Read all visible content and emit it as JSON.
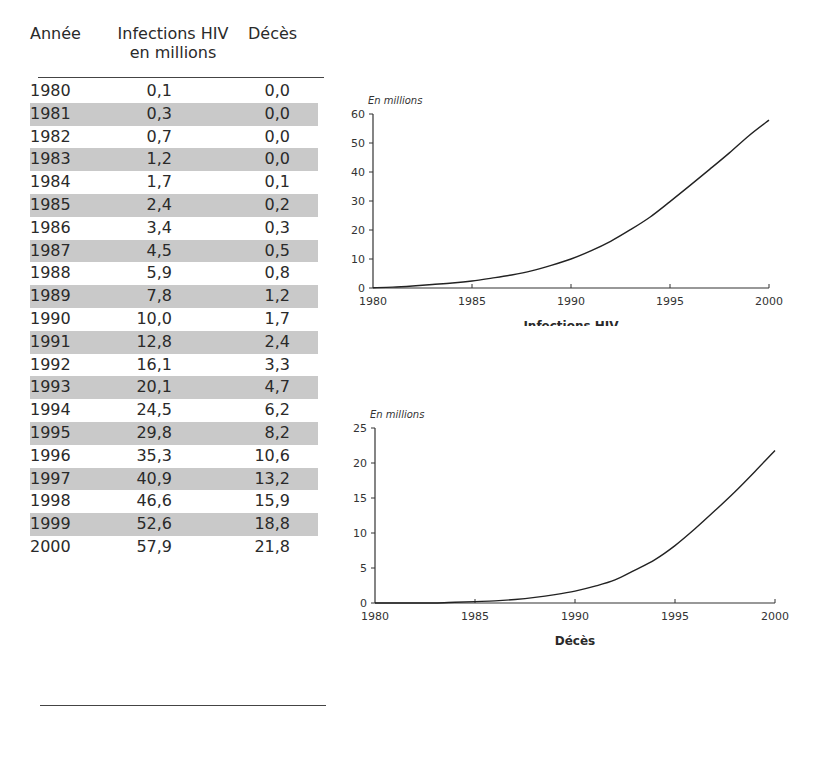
{
  "table": {
    "headers": {
      "year": "Année",
      "infections_line1": "Infections HIV",
      "infections_line2": "en millions",
      "deaths": "Décès"
    },
    "rows": [
      {
        "year": "1980",
        "infections": "0,1",
        "deaths": "0,0"
      },
      {
        "year": "1981",
        "infections": "0,3",
        "deaths": "0,0"
      },
      {
        "year": "1982",
        "infections": "0,7",
        "deaths": "0,0"
      },
      {
        "year": "1983",
        "infections": "1,2",
        "deaths": "0,0"
      },
      {
        "year": "1984",
        "infections": "1,7",
        "deaths": "0,1"
      },
      {
        "year": "1985",
        "infections": "2,4",
        "deaths": "0,2"
      },
      {
        "year": "1986",
        "infections": "3,4",
        "deaths": "0,3"
      },
      {
        "year": "1987",
        "infections": "4,5",
        "deaths": "0,5"
      },
      {
        "year": "1988",
        "infections": "5,9",
        "deaths": "0,8"
      },
      {
        "year": "1989",
        "infections": "7,8",
        "deaths": "1,2"
      },
      {
        "year": "1990",
        "infections": "10,0",
        "deaths": "1,7"
      },
      {
        "year": "1991",
        "infections": "12,8",
        "deaths": "2,4"
      },
      {
        "year": "1992",
        "infections": "16,1",
        "deaths": "3,3"
      },
      {
        "year": "1993",
        "infections": "20,1",
        "deaths": "4,7"
      },
      {
        "year": "1994",
        "infections": "24,5",
        "deaths": "6,2"
      },
      {
        "year": "1995",
        "infections": "29,8",
        "deaths": "8,2"
      },
      {
        "year": "1996",
        "infections": "35,3",
        "deaths": "10,6"
      },
      {
        "year": "1997",
        "infections": "40,9",
        "deaths": "13,2"
      },
      {
        "year": "1998",
        "infections": "46,6",
        "deaths": "15,9"
      },
      {
        "year": "1999",
        "infections": "52,6",
        "deaths": "18,8"
      },
      {
        "year": "2000",
        "infections": "57,9",
        "deaths": "21,8"
      }
    ]
  },
  "charts": {
    "infections": {
      "unit_label": "En millions",
      "title": "Infections HIV",
      "yticks": [
        "0",
        "10",
        "20",
        "30",
        "40",
        "50",
        "60"
      ],
      "xticks": [
        "1980",
        "1985",
        "1990",
        "1995",
        "2000"
      ]
    },
    "deaths": {
      "unit_label": "En millions",
      "title": "Décès",
      "yticks": [
        "0",
        "5",
        "10",
        "15",
        "20",
        "25"
      ],
      "xticks": [
        "1980",
        "1985",
        "1990",
        "1995",
        "2000"
      ]
    }
  },
  "chart_data": [
    {
      "type": "line",
      "title": "Infections HIV",
      "xlabel": "",
      "ylabel": "En millions",
      "x": [
        1980,
        1981,
        1982,
        1983,
        1984,
        1985,
        1986,
        1987,
        1988,
        1989,
        1990,
        1991,
        1992,
        1993,
        1994,
        1995,
        1996,
        1997,
        1998,
        1999,
        2000
      ],
      "series": [
        {
          "name": "Infections HIV (millions)",
          "values": [
            0.1,
            0.3,
            0.7,
            1.2,
            1.7,
            2.4,
            3.4,
            4.5,
            5.9,
            7.8,
            10.0,
            12.8,
            16.1,
            20.1,
            24.5,
            29.8,
            35.3,
            40.9,
            46.6,
            52.6,
            57.9
          ]
        }
      ],
      "xlim": [
        1980,
        2000
      ],
      "ylim": [
        0,
        60
      ],
      "yticks": [
        0,
        10,
        20,
        30,
        40,
        50,
        60
      ],
      "xticks": [
        1980,
        1985,
        1990,
        1995,
        2000
      ],
      "grid": false,
      "legend": "none"
    },
    {
      "type": "line",
      "title": "Décès",
      "xlabel": "",
      "ylabel": "En millions",
      "x": [
        1980,
        1981,
        1982,
        1983,
        1984,
        1985,
        1986,
        1987,
        1988,
        1989,
        1990,
        1991,
        1992,
        1993,
        1994,
        1995,
        1996,
        1997,
        1998,
        1999,
        2000
      ],
      "series": [
        {
          "name": "Décès (millions)",
          "values": [
            0.0,
            0.0,
            0.0,
            0.0,
            0.1,
            0.2,
            0.3,
            0.5,
            0.8,
            1.2,
            1.7,
            2.4,
            3.3,
            4.7,
            6.2,
            8.2,
            10.6,
            13.2,
            15.9,
            18.8,
            21.8
          ]
        }
      ],
      "xlim": [
        1980,
        2000
      ],
      "ylim": [
        0,
        25
      ],
      "yticks": [
        0,
        5,
        10,
        15,
        20,
        25
      ],
      "xticks": [
        1980,
        1985,
        1990,
        1995,
        2000
      ],
      "grid": false,
      "legend": "none"
    }
  ]
}
